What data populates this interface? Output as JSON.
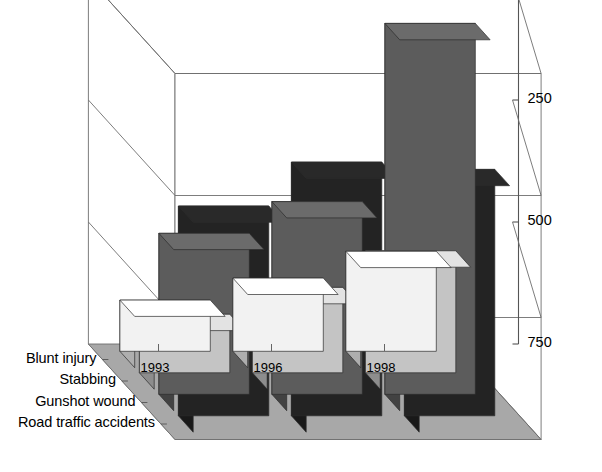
{
  "chart_data": {
    "type": "bar",
    "title": "",
    "subtitle": "",
    "xlabel": "",
    "ylabel": "",
    "categories": [
      "1993",
      "1996",
      "1998"
    ],
    "series": [
      {
        "name": "Road traffic accidents",
        "values": [
          430,
          520,
          505
        ],
        "color": "#232323"
      },
      {
        "name": "Gunshot wound",
        "values": [
          330,
          395,
          760
        ],
        "color": "#5c5c5c"
      },
      {
        "name": "Stabbing",
        "values": [
          120,
          175,
          250
        ],
        "color": "#c4c4c4"
      },
      {
        "name": "Blunt injury",
        "values": [
          105,
          150,
          205
        ],
        "color": "#f2f2f2"
      }
    ],
    "yticks": [
      0,
      250,
      500,
      750
    ],
    "ylim": [
      0,
      750
    ],
    "grid": true,
    "legend_position": "axis-left",
    "projection": "3d"
  },
  "axis": {
    "y_ticks": [
      "750",
      "500",
      "250",
      "0"
    ],
    "x_ticks": [
      "1993",
      "1996",
      "1998"
    ],
    "z_ticks": [
      "Road traffic accidents",
      "Gunshot wound",
      "Stabbing",
      "Blunt injury"
    ]
  },
  "style": {
    "floor_color": "#a8a8a8",
    "wall_color": "#ffffff",
    "line_color": "#6e6e6e",
    "axis_color": "#555555"
  }
}
